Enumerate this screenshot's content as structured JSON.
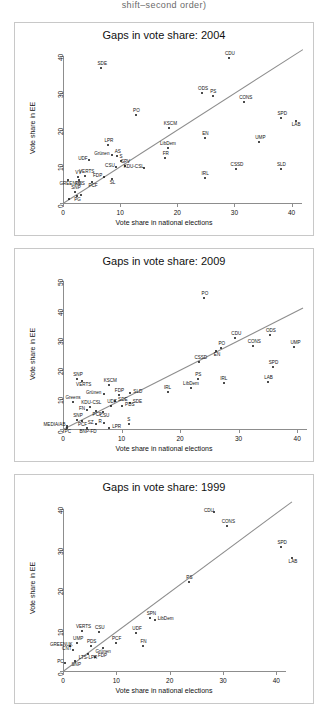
{
  "page": {
    "header_text": "shift–second order)"
  },
  "axis": {
    "xlabel": "Vote share in national elections",
    "ylabel": "Vote share in EE"
  },
  "chart_data": [
    {
      "type": "scatter",
      "title": "Gaps in vote share: 2004",
      "xlabel": "Vote share in national elections",
      "ylabel": "Vote share in EE",
      "xlim": [
        0,
        42
      ],
      "ylim": [
        0,
        42
      ],
      "xticks": [
        0,
        10,
        20,
        30,
        40
      ],
      "yticks": [
        0,
        10,
        20,
        30,
        40
      ],
      "grid": false,
      "reference_line": {
        "type": "identity",
        "from": [
          0,
          0
        ],
        "to": [
          42,
          42
        ]
      },
      "points": [
        {
          "label": "SDE",
          "x": 6.7,
          "y": 36.8,
          "lp": "above"
        },
        {
          "label": "CDU",
          "x": 29.0,
          "y": 39.5,
          "lp": "above"
        },
        {
          "label": "ODS",
          "x": 24.3,
          "y": 30.0,
          "lp": "above"
        },
        {
          "label": "PS",
          "x": 26.2,
          "y": 29.1,
          "lp": "above"
        },
        {
          "label": "CONS",
          "x": 31.7,
          "y": 27.6,
          "lp": "above"
        },
        {
          "label": "PO",
          "x": 12.7,
          "y": 24.1,
          "lp": "above"
        },
        {
          "label": "SPD",
          "x": 38.2,
          "y": 23.3,
          "lp": "above"
        },
        {
          "label": "LAB",
          "x": 40.7,
          "y": 22.5,
          "lp": "below"
        },
        {
          "label": "KSCM",
          "x": 18.5,
          "y": 20.5,
          "lp": "above"
        },
        {
          "label": "EN",
          "x": 24.8,
          "y": 17.7,
          "lp": "above"
        },
        {
          "label": "UMP",
          "x": 34.3,
          "y": 16.7,
          "lp": "above"
        },
        {
          "label": "LPR",
          "x": 7.9,
          "y": 15.9,
          "lp": "above"
        },
        {
          "label": "LibDem",
          "x": 18.3,
          "y": 15.1,
          "lp": "above"
        },
        {
          "label": "Grünen",
          "x": 8.6,
          "y": 13.0,
          "lp": "left"
        },
        {
          "label": "AS",
          "x": 9.5,
          "y": 12.9,
          "lp": "above"
        },
        {
          "label": "FR",
          "x": 17.9,
          "y": 12.2,
          "lp": "above"
        },
        {
          "label": "UDF",
          "x": 4.5,
          "y": 11.8,
          "lp": "left"
        },
        {
          "label": "S",
          "x": 10.1,
          "y": 11.5,
          "lp": "above"
        },
        {
          "label": "SPV",
          "x": 10.8,
          "y": 10.0,
          "lp": "above"
        },
        {
          "label": "CSU",
          "x": 9.2,
          "y": 9.7,
          "lp": "left"
        },
        {
          "label": "KDU-CSL",
          "x": 14.2,
          "y": 9.6,
          "lp": "left"
        },
        {
          "label": "SLD",
          "x": 38.1,
          "y": 9.4,
          "lp": "above"
        },
        {
          "label": "CSSD",
          "x": 30.2,
          "y": 9.2,
          "lp": "above"
        },
        {
          "label": "VERTS",
          "x": 3.9,
          "y": 7.5,
          "lp": "above"
        },
        {
          "label": "VV",
          "x": 2.6,
          "y": 7.1,
          "lp": "above"
        },
        {
          "label": "FDP",
          "x": 7.1,
          "y": 7.0,
          "lp": "left"
        },
        {
          "label": "SL",
          "x": 8.6,
          "y": 6.5,
          "lp": "below"
        },
        {
          "label": "PDS",
          "x": 2.8,
          "y": 6.3,
          "lp": "below"
        },
        {
          "label": "IRL",
          "x": 24.9,
          "y": 6.7,
          "lp": "above"
        },
        {
          "label": "PCF",
          "x": 5.1,
          "y": 5.7,
          "lp": "below"
        },
        {
          "label": "GREENUK",
          "x": 0.9,
          "y": 6.2,
          "lp": "below"
        },
        {
          "label": "SNP",
          "x": 2.1,
          "y": 2.9,
          "lp": "above"
        },
        {
          "label": "PG",
          "x": 2.4,
          "y": 1.8,
          "lp": "below"
        },
        {
          "label": "",
          "x": 1.0,
          "y": 1.2,
          "lp": "none"
        },
        {
          "label": "",
          "x": 3.1,
          "y": 2.3,
          "lp": "none"
        }
      ]
    },
    {
      "type": "scatter",
      "title": "Gaps in vote share: 2009",
      "xlabel": "Vote share in national elections",
      "ylabel": "Vote share in EE",
      "xlim": [
        0,
        41
      ],
      "ylim": [
        0,
        52
      ],
      "xticks": [
        0,
        10,
        20,
        30,
        40
      ],
      "yticks": [
        0,
        10,
        20,
        30,
        40,
        50
      ],
      "grid": false,
      "reference_line": {
        "type": "identity",
        "from": [
          0,
          0
        ],
        "to": [
          41,
          41
        ]
      },
      "points": [
        {
          "label": "PO",
          "x": 24.1,
          "y": 44.4,
          "lp": "above"
        },
        {
          "label": "ODS",
          "x": 35.3,
          "y": 31.7,
          "lp": "above"
        },
        {
          "label": "CDU",
          "x": 29.4,
          "y": 30.7,
          "lp": "above"
        },
        {
          "label": "CONS",
          "x": 32.4,
          "y": 28.0,
          "lp": "above"
        },
        {
          "label": "UMP",
          "x": 39.5,
          "y": 27.8,
          "lp": "above"
        },
        {
          "label": "PO",
          "x": 27.0,
          "y": 27.4,
          "lp": "above"
        },
        {
          "label": "EN",
          "x": 26.2,
          "y": 26.2,
          "lp": "below"
        },
        {
          "label": "CSSD",
          "x": 23.3,
          "y": 22.6,
          "lp": "above"
        },
        {
          "label": "SPD",
          "x": 35.8,
          "y": 21.1,
          "lp": "above"
        },
        {
          "label": "SNP",
          "x": 2.4,
          "y": 17.0,
          "lp": "above"
        },
        {
          "label": "PS",
          "x": 23.0,
          "y": 16.9,
          "lp": "above"
        },
        {
          "label": "VERTS",
          "x": 3.3,
          "y": 16.3,
          "lp": "below"
        },
        {
          "label": "LAB",
          "x": 35.0,
          "y": 15.8,
          "lp": "above"
        },
        {
          "label": "IRL",
          "x": 27.5,
          "y": 15.5,
          "lp": "above"
        },
        {
          "label": "KSCM",
          "x": 7.8,
          "y": 14.8,
          "lp": "above"
        },
        {
          "label": "LibDem",
          "x": 21.8,
          "y": 13.8,
          "lp": "above"
        },
        {
          "label": "IRL",
          "x": 17.9,
          "y": 12.4,
          "lp": "above"
        },
        {
          "label": "SLD",
          "x": 11.5,
          "y": 12.3,
          "lp": "right"
        },
        {
          "label": "Grünen",
          "x": 7.0,
          "y": 11.8,
          "lp": "left"
        },
        {
          "label": "FDP",
          "x": 9.5,
          "y": 11.4,
          "lp": "above"
        },
        {
          "label": "SDE",
          "x": 8.9,
          "y": 9.5,
          "lp": "right"
        },
        {
          "label": "SDE",
          "x": 11.4,
          "y": 8.9,
          "lp": "right"
        },
        {
          "label": "Greens",
          "x": 1.7,
          "y": 9.0,
          "lp": "above"
        },
        {
          "label": "PDS",
          "x": 10.1,
          "y": 7.8,
          "lp": "right"
        },
        {
          "label": "KDU-CSL",
          "x": 4.6,
          "y": 7.5,
          "lp": "above"
        },
        {
          "label": "UDF",
          "x": 8.2,
          "y": 7.6,
          "lp": "above"
        },
        {
          "label": "FN",
          "x": 4.1,
          "y": 6.3,
          "lp": "left"
        },
        {
          "label": "PCF",
          "x": 5.7,
          "y": 6.0,
          "lp": "below"
        },
        {
          "label": "CSU",
          "x": 6.9,
          "y": 5.6,
          "lp": "below"
        },
        {
          "label": "SNP",
          "x": 2.4,
          "y": 3.2,
          "lp": "above"
        },
        {
          "label": "PCF",
          "x": 3.2,
          "y": 2.6,
          "lp": "below"
        },
        {
          "label": "SZ",
          "x": 5.6,
          "y": 1.8,
          "lp": "left"
        },
        {
          "label": "R",
          "x": 7.0,
          "y": 1.9,
          "lp": "left"
        },
        {
          "label": "S",
          "x": 11.2,
          "y": 1.6,
          "lp": "above"
        },
        {
          "label": "MEDIA/AB",
          "x": 0.6,
          "y": 1.1,
          "lp": "left"
        },
        {
          "label": "LPR",
          "x": 7.9,
          "y": 0.5,
          "lp": "right"
        },
        {
          "label": "BNP-FD",
          "x": 4.1,
          "y": 0.4,
          "lp": "below"
        },
        {
          "label": "PC",
          "x": 0.7,
          "y": 0.3,
          "lp": "below"
        }
      ]
    },
    {
      "type": "scatter",
      "title": "Gaps in vote share: 1999",
      "xlabel": "Vote share in national elections",
      "ylabel": "Vote share in EE",
      "xlim": [
        0,
        45
      ],
      "ylim": [
        0,
        42
      ],
      "xticks": [
        0,
        10,
        20,
        30,
        40
      ],
      "yticks": [
        0,
        10,
        20,
        30,
        40
      ],
      "grid": false,
      "reference_line": {
        "type": "identity",
        "from": [
          0,
          0
        ],
        "to": [
          43,
          43
        ]
      },
      "points": [
        {
          "label": "CDU",
          "x": 28.4,
          "y": 39.3,
          "lp": "left"
        },
        {
          "label": "CONS",
          "x": 30.7,
          "y": 35.8,
          "lp": "above"
        },
        {
          "label": "SPD",
          "x": 40.9,
          "y": 30.7,
          "lp": "above"
        },
        {
          "label": "LAB",
          "x": 43.0,
          "y": 28.0,
          "lp": "below"
        },
        {
          "label": "PS",
          "x": 23.6,
          "y": 22.0,
          "lp": "above"
        },
        {
          "label": "SPN",
          "x": 16.4,
          "y": 13.2,
          "lp": "above"
        },
        {
          "label": "LibDem",
          "x": 17.2,
          "y": 12.6,
          "lp": "right"
        },
        {
          "label": "VERTS",
          "x": 3.6,
          "y": 9.8,
          "lp": "above"
        },
        {
          "label": "CSU",
          "x": 6.7,
          "y": 9.7,
          "lp": "above"
        },
        {
          "label": "UDF",
          "x": 13.7,
          "y": 9.3,
          "lp": "above"
        },
        {
          "label": "PCF",
          "x": 9.9,
          "y": 6.9,
          "lp": "above"
        },
        {
          "label": "UMP",
          "x": 2.6,
          "y": 7.0,
          "lp": "above"
        },
        {
          "label": "PDS",
          "x": 5.2,
          "y": 6.3,
          "lp": "above"
        },
        {
          "label": "GREENUK",
          "x": 1.4,
          "y": 6.2,
          "lp": "left"
        },
        {
          "label": "FN",
          "x": 15.0,
          "y": 6.1,
          "lp": "above"
        },
        {
          "label": "CNT",
          "x": 1.8,
          "y": 5.3,
          "lp": "left"
        },
        {
          "label": "Grünen",
          "x": 7.5,
          "y": 5.6,
          "lp": "below"
        },
        {
          "label": "LTS-LPR",
          "x": 4.6,
          "y": 4.1,
          "lp": "below"
        },
        {
          "label": "FDP",
          "x": 6.0,
          "y": 3.4,
          "lp": "right"
        },
        {
          "label": "PC",
          "x": 0.4,
          "y": 1.9,
          "lp": "left"
        },
        {
          "label": "SNP",
          "x": 2.3,
          "y": 2.4,
          "lp": "below"
        }
      ]
    }
  ]
}
